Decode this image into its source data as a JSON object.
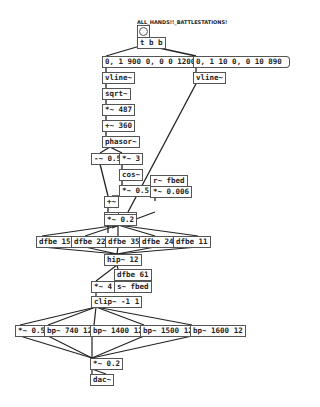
{
  "patch": {
    "label": "ALL_HANDS!!_BATTLESTATIONS!",
    "objects": {
      "tbb": "t b b",
      "msg1": "0, 1 900 0, 0 0 1200",
      "msg2": "0, 1 10 0, 0 10 890",
      "vline1": "vline~",
      "vline2": "vline~",
      "sqrt": "sqrt~",
      "mul487": "*~ 487",
      "add360": "+~ 360",
      "phasor": "phasor~",
      "mul05a": "-~ 0.5",
      "mul3": "*~ 3",
      "cos": "cos~",
      "mul05b": "*~ 0.5",
      "plus": "+~",
      "hip1": "hip~ 1",
      "rfbed": "r~ fbed",
      "mul0006": "*~ 0.006",
      "mulsig": "*~",
      "mul02a": "*~ 0.2",
      "dfbe15": "dfbe 15",
      "dfbe22": "dfbe 22",
      "dfbe35": "dfbe 35",
      "dfbe24": "dfbe 24",
      "dfbe11": "dfbe 11",
      "hip12": "hip~ 12",
      "dfbe61": "dfbe 61",
      "mul4": "*~ 4",
      "sfbed": "s~ fbed",
      "clip": "clip~ -1 1",
      "mul05c": "*~ 0.5",
      "bp740": "bp~ 740 12",
      "bp1400": "bp~ 1400 12",
      "bp1500": "bp~ 1500 12",
      "bp1600": "bp~ 1600 12",
      "mul02b": "*~ 0.2",
      "dac": "dac~"
    }
  }
}
